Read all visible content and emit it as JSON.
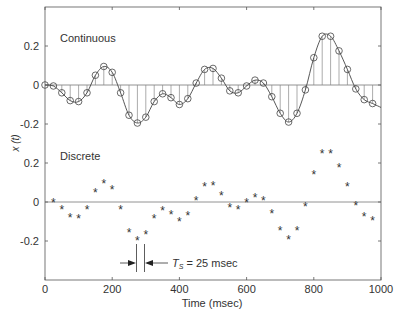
{
  "chart_data": {
    "type": "line",
    "title": "",
    "xlabel": "Time (msec)",
    "ylabel": "x (t)",
    "xlim": [
      0,
      1000
    ],
    "x_ticks": [
      0,
      200,
      400,
      600,
      800,
      1000
    ],
    "x_tick_labels": [
      "0",
      "200",
      "400",
      "600",
      "800",
      "1000"
    ],
    "y_tick_labels": [
      "0.2",
      "0",
      "-0.2",
      "0.2",
      "0",
      "-0.2"
    ],
    "grid": false,
    "panels": [
      {
        "name": "Continuous",
        "label": "Continuous",
        "style": "line with stems and circle markers",
        "ylim": [
          -0.3,
          0.3
        ]
      },
      {
        "name": "Discrete",
        "label": "Discrete",
        "style": "asterisk markers",
        "ylim": [
          -0.3,
          0.3
        ]
      }
    ],
    "sample_period_ms": 25,
    "annotation": {
      "symbol": "T",
      "subscript": "S",
      "text": " = 25 msec"
    },
    "x": [
      0,
      25,
      50,
      75,
      100,
      125,
      150,
      175,
      200,
      225,
      250,
      275,
      300,
      325,
      350,
      375,
      400,
      425,
      450,
      475,
      500,
      525,
      550,
      575,
      600,
      625,
      650,
      675,
      700,
      725,
      750,
      775,
      800,
      825,
      850,
      875,
      900,
      925,
      950,
      975
    ],
    "series": [
      {
        "name": "Continuous",
        "values": [
          0,
          -0.005,
          -0.04,
          -0.08,
          -0.085,
          -0.04,
          0.05,
          0.095,
          0.065,
          -0.04,
          -0.155,
          -0.195,
          -0.165,
          -0.085,
          -0.045,
          -0.065,
          -0.1,
          -0.07,
          0.01,
          0.08,
          0.085,
          0.035,
          -0.03,
          -0.04,
          -0.005,
          0.025,
          0.01,
          -0.06,
          -0.145,
          -0.19,
          -0.145,
          -0.025,
          0.14,
          0.25,
          0.25,
          0.175,
          0.08,
          -0.02,
          -0.075,
          -0.095
        ]
      },
      {
        "name": "Discrete",
        "values": [
          0,
          -0.005,
          -0.04,
          -0.08,
          -0.085,
          -0.04,
          0.05,
          0.095,
          0.065,
          -0.04,
          -0.155,
          -0.195,
          -0.165,
          -0.085,
          -0.045,
          -0.065,
          -0.1,
          -0.07,
          0.01,
          0.08,
          0.085,
          0.035,
          -0.03,
          -0.04,
          -0.005,
          0.025,
          0.01,
          -0.06,
          -0.145,
          -0.19,
          -0.145,
          -0.025,
          0.14,
          0.25,
          0.25,
          0.175,
          0.08,
          -0.02,
          -0.075,
          -0.095
        ]
      }
    ],
    "continuous_end_value": -0.115
  }
}
